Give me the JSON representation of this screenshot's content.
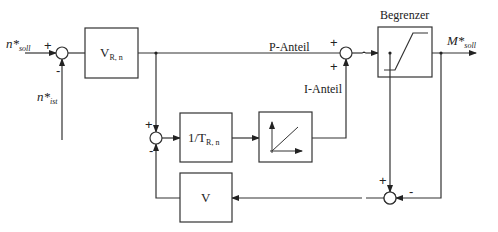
{
  "diagram": {
    "type": "block diagram",
    "inputs": {
      "setpoint": {
        "base": "n*",
        "sub": "soll"
      },
      "actual": {
        "base": "n*",
        "sub": "ist"
      }
    },
    "output": {
      "base": "M*",
      "sub": "soll"
    },
    "blocks": {
      "gain": {
        "base": "V",
        "sub": "R, n"
      },
      "reset": {
        "base": "1/T",
        "sub": "R, n"
      },
      "integrator": {
        "symbol": "ramp"
      },
      "limiter": {
        "title": "Begrenzer",
        "symbol": "saturation"
      },
      "feedback_gain": {
        "label": "V"
      }
    },
    "signal_labels": {
      "p_part": "P-Anteil",
      "i_part": "I-Anteil"
    },
    "signs": {
      "sum1_in": "+",
      "sum1_fb": "-",
      "sum2_top": "+",
      "sum2_bottom": "-",
      "sum3_left": "+",
      "sum3_bottom": "+",
      "sum4_top": "+",
      "sum4_right": "-"
    }
  }
}
